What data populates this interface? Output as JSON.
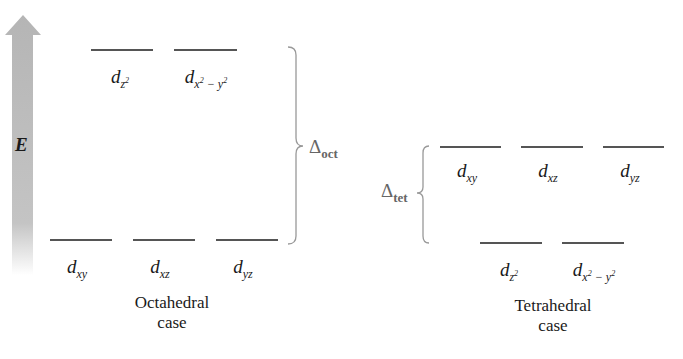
{
  "energy_axis": {
    "label": "E",
    "color": "#b8b8b8"
  },
  "octahedral": {
    "upper_orbitals": [
      {
        "base": "d",
        "sub": "z",
        "sup": "2",
        "tail": ""
      },
      {
        "base": "d",
        "sub": "x",
        "sup": "2",
        "tail": "− y",
        "sup2": "2"
      }
    ],
    "lower_orbitals": [
      {
        "base": "d",
        "sub": "xy"
      },
      {
        "base": "d",
        "sub": "xz"
      },
      {
        "base": "d",
        "sub": "yz"
      }
    ],
    "splitting_symbol": "Δ",
    "splitting_sub": "oct",
    "caption_line1": "Octahedral",
    "caption_line2": "case"
  },
  "tetrahedral": {
    "upper_orbitals": [
      {
        "base": "d",
        "sub": "xy"
      },
      {
        "base": "d",
        "sub": "xz"
      },
      {
        "base": "d",
        "sub": "yz"
      }
    ],
    "lower_orbitals": [
      {
        "base": "d",
        "sub": "z",
        "sup": "2",
        "tail": ""
      },
      {
        "base": "d",
        "sub": "x",
        "sup": "2",
        "tail": "− y",
        "sup2": "2"
      }
    ],
    "splitting_symbol": "Δ",
    "splitting_sub": "tet",
    "caption_line1": "Tetrahedral",
    "caption_line2": "case"
  },
  "colors": {
    "level_line": "#555555",
    "brace": "#999999",
    "delta_text": "#666666"
  }
}
